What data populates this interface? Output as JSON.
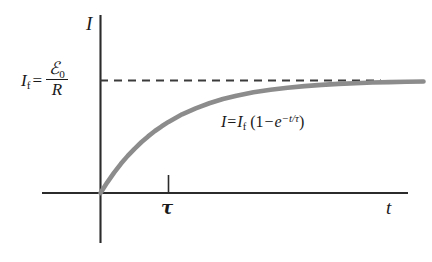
{
  "chart_data": {
    "type": "line",
    "title": "",
    "xlabel": "t",
    "ylabel": "I",
    "grid": false,
    "legend": false,
    "xlim": [
      -0.55,
      5.6
    ],
    "ylim": [
      -1.4,
      1.32
    ],
    "asymptote": {
      "label": "I_f",
      "value": 1.0,
      "style": "dashed",
      "color": "#3b3b3b"
    },
    "x_ticks": [
      {
        "x": 1.0,
        "label": "τ"
      }
    ],
    "series": [
      {
        "name": "I = I_f (1 - e^{-t/τ})",
        "color": "#8c8c8c",
        "formula": "I = I_f * (1 - exp(-t/tau))",
        "x": [
          0.0,
          0.1,
          0.2,
          0.3,
          0.4,
          0.5,
          0.6,
          0.7,
          0.8,
          0.9,
          1.0,
          1.2,
          1.4,
          1.6,
          1.8,
          2.0,
          2.25,
          2.5,
          2.75,
          3.0,
          3.25,
          3.5,
          3.75,
          4.0,
          4.25,
          4.5,
          4.75
        ],
        "y": [
          0.0,
          0.095,
          0.181,
          0.259,
          0.33,
          0.393,
          0.451,
          0.503,
          0.551,
          0.593,
          0.632,
          0.699,
          0.753,
          0.798,
          0.835,
          0.865,
          0.895,
          0.918,
          0.936,
          0.95,
          0.961,
          0.97,
          0.976,
          0.982,
          0.986,
          0.989,
          0.991
        ]
      }
    ]
  },
  "labels": {
    "y_axis": "I",
    "x_axis": "t",
    "tau_tick": "τ",
    "final_current": {
      "symbol": "I",
      "subscript": "f",
      "equals": "=",
      "numerator_symbol": "ℰ",
      "numerator_subscript": "0",
      "denominator": "R",
      "plain": "I_f = ℰ0 / R"
    },
    "equation": {
      "lhs_symbol": "I",
      "equals": "=",
      "rhs_symbol": "I",
      "rhs_subscript": "f",
      "open_paren": "(",
      "one": "1",
      "minus": "−",
      "exp_base": "e",
      "exponent_minus": "−",
      "exponent_t": "t",
      "exponent_slash": "/",
      "exponent_tau": "τ",
      "close_paren": ")",
      "plain": "I = I_f (1 − e^{−t/τ})"
    }
  },
  "colors": {
    "axis": "#2b2b2b",
    "curve": "#8c8c8c",
    "dashed": "#3b3b3b",
    "background": "#ffffff",
    "text": "#1a1a1a"
  }
}
